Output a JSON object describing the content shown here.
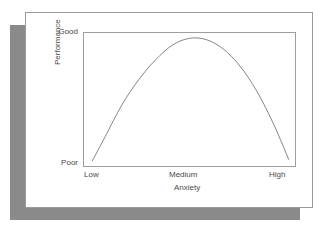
{
  "figure": {
    "card_background": "#ffffff",
    "card_border_color": "#9a9a9a",
    "shadow_color": "#8a8a8a",
    "plot_border_color": "#9e9e9e",
    "curve_color": "#3a3a3a"
  },
  "chart_data": {
    "type": "line",
    "title": "",
    "subtitle": "",
    "xlabel": "Anxiety",
    "ylabel": "Performance",
    "xticklabels": [
      "Low",
      "Medium",
      "High"
    ],
    "yticklabels": [
      "Poor",
      "Good"
    ],
    "xlim": [
      0,
      100
    ],
    "ylim": [
      0,
      100
    ],
    "grid": false,
    "legend": null,
    "annotations": [],
    "series": [
      {
        "name": "Performance vs Anxiety",
        "color": "#3a3a3a",
        "x": [
          4,
          10,
          18,
          26,
          34,
          42,
          50,
          58,
          66,
          74,
          82,
          90,
          97
        ],
        "y": [
          4,
          22,
          46,
          65,
          80,
          91,
          96,
          95,
          88,
          75,
          56,
          31,
          5
        ]
      }
    ]
  }
}
